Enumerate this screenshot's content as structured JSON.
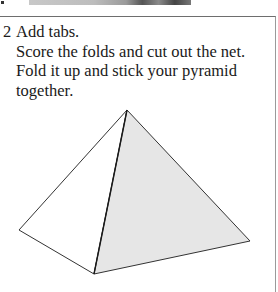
{
  "step": {
    "number": "2",
    "lines": [
      "Add tabs.",
      "Score the folds and cut out the net.",
      "Fold it up and stick your pyramid",
      "together."
    ]
  },
  "figure": {
    "left_face_color": "#ffffff",
    "right_face_color": "#e6e6e6",
    "edge_color": "#333333"
  }
}
